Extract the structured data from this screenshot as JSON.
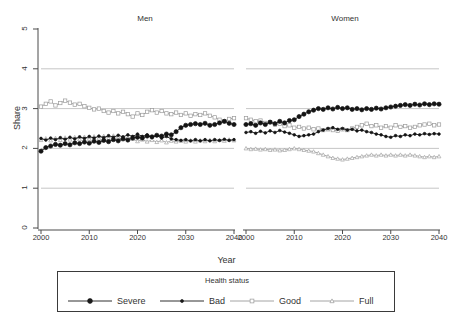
{
  "chart_title": "",
  "axes": {
    "ylabel": "Share",
    "xlabel": "Year",
    "yticks": [
      "0",
      "1",
      "2",
      "3",
      "4",
      "5"
    ],
    "xticks": [
      "2000",
      "2010",
      "2020",
      "2030",
      "2040"
    ],
    "ylim": [
      0,
      5
    ],
    "xlim": [
      2000,
      2040
    ],
    "gridlines_y": [
      1,
      2,
      3,
      4
    ]
  },
  "panels": [
    {
      "key": "men",
      "title": "Men"
    },
    {
      "key": "women",
      "title": "Women"
    }
  ],
  "legend": {
    "title": "Health status",
    "entries": [
      {
        "label": "Severe",
        "marker": "filled-circle-large",
        "color": "#1a1a1a"
      },
      {
        "label": "Bad",
        "marker": "filled-circle-small",
        "color": "#1a1a1a"
      },
      {
        "label": "Good",
        "marker": "open-square",
        "color": "#9a9a9a"
      },
      {
        "label": "Full",
        "marker": "open-triangle",
        "color": "#9a9a9a"
      }
    ]
  },
  "colors": {
    "severe": "#141414",
    "bad": "#141414",
    "good": "#9b9b9b",
    "full": "#a3a3a3",
    "grid": "#b8b8b8",
    "axis": "#4a4a4a"
  },
  "chart_data": {
    "type": "line",
    "title": "",
    "xlabel": "Year",
    "ylabel": "Share",
    "xlim": [
      2000,
      2040
    ],
    "ylim": [
      0,
      5
    ],
    "grid": true,
    "legend_position": "bottom",
    "legend_title": "Health status",
    "x": [
      2000,
      2001,
      2002,
      2003,
      2004,
      2005,
      2006,
      2007,
      2008,
      2009,
      2010,
      2011,
      2012,
      2013,
      2014,
      2015,
      2016,
      2017,
      2018,
      2019,
      2020,
      2021,
      2022,
      2023,
      2024,
      2025,
      2026,
      2027,
      2028,
      2029,
      2030,
      2031,
      2032,
      2033,
      2034,
      2035,
      2036,
      2037,
      2038,
      2039,
      2040
    ],
    "panels": [
      {
        "name": "Men",
        "series": [
          {
            "name": "Severe",
            "values": [
              1.93,
              2.02,
              2.06,
              2.1,
              2.08,
              2.12,
              2.09,
              2.14,
              2.12,
              2.16,
              2.13,
              2.18,
              2.15,
              2.2,
              2.17,
              2.22,
              2.19,
              2.24,
              2.21,
              2.26,
              2.28,
              2.26,
              2.31,
              2.29,
              2.33,
              2.31,
              2.36,
              2.34,
              2.42,
              2.52,
              2.58,
              2.6,
              2.62,
              2.6,
              2.63,
              2.58,
              2.6,
              2.64,
              2.68,
              2.63,
              2.6
            ]
          },
          {
            "name": "Bad",
            "values": [
              2.25,
              2.21,
              2.26,
              2.22,
              2.27,
              2.23,
              2.28,
              2.24,
              2.29,
              2.25,
              2.3,
              2.26,
              2.31,
              2.27,
              2.32,
              2.28,
              2.33,
              2.29,
              2.34,
              2.3,
              2.36,
              2.3,
              2.34,
              2.28,
              2.32,
              2.26,
              2.3,
              2.24,
              2.22,
              2.2,
              2.22,
              2.19,
              2.22,
              2.19,
              2.22,
              2.19,
              2.22,
              2.2,
              2.23,
              2.2,
              2.22
            ]
          },
          {
            "name": "Good",
            "values": [
              3.05,
              3.12,
              3.18,
              3.08,
              3.14,
              3.2,
              3.15,
              3.1,
              3.12,
              3.06,
              3.02,
              2.98,
              3.0,
              2.94,
              2.9,
              2.94,
              2.88,
              2.92,
              2.86,
              2.8,
              2.88,
              2.84,
              2.92,
              2.96,
              2.9,
              2.94,
              2.88,
              2.86,
              2.9,
              2.84,
              2.88,
              2.82,
              2.86,
              2.84,
              2.88,
              2.82,
              2.78,
              2.72,
              2.68,
              2.74,
              2.76
            ]
          },
          {
            "name": "Full",
            "values": [
              2.21,
              2.25,
              2.2,
              2.26,
              2.21,
              2.27,
              2.22,
              2.28,
              2.23,
              2.29,
              2.24,
              2.3,
              2.25,
              2.31,
              2.26,
              2.32,
              2.27,
              2.23,
              2.28,
              2.24,
              2.18,
              2.22,
              2.17,
              2.21,
              2.16,
              2.2,
              2.15,
              2.19,
              2.17,
              2.19,
              2.17,
              2.2,
              2.17,
              2.2,
              2.18,
              2.21,
              2.18,
              2.21,
              2.19,
              2.22,
              2.2
            ]
          }
        ]
      },
      {
        "name": "Women",
        "series": [
          {
            "name": "Severe",
            "values": [
              2.6,
              2.62,
              2.58,
              2.64,
              2.6,
              2.66,
              2.62,
              2.68,
              2.64,
              2.7,
              2.72,
              2.8,
              2.86,
              2.92,
              2.96,
              3.0,
              2.98,
              3.02,
              2.99,
              3.03,
              3.0,
              3.02,
              2.98,
              3.0,
              2.97,
              3.0,
              2.98,
              3.01,
              2.99,
              3.02,
              3.04,
              3.06,
              3.08,
              3.1,
              3.08,
              3.11,
              3.09,
              3.12,
              3.1,
              3.12,
              3.11
            ]
          },
          {
            "name": "Bad",
            "values": [
              2.4,
              2.42,
              2.38,
              2.43,
              2.39,
              2.44,
              2.4,
              2.45,
              2.41,
              2.38,
              2.34,
              2.3,
              2.32,
              2.34,
              2.36,
              2.42,
              2.46,
              2.5,
              2.52,
              2.48,
              2.5,
              2.46,
              2.48,
              2.44,
              2.46,
              2.42,
              2.4,
              2.36,
              2.34,
              2.3,
              2.28,
              2.32,
              2.3,
              2.34,
              2.32,
              2.36,
              2.34,
              2.37,
              2.35,
              2.37,
              2.36
            ]
          },
          {
            "name": "Good",
            "values": [
              2.76,
              2.72,
              2.68,
              2.7,
              2.64,
              2.66,
              2.6,
              2.62,
              2.56,
              2.58,
              2.52,
              2.54,
              2.5,
              2.52,
              2.48,
              2.5,
              2.46,
              2.48,
              2.46,
              2.44,
              2.48,
              2.46,
              2.5,
              2.54,
              2.58,
              2.62,
              2.56,
              2.58,
              2.52,
              2.56,
              2.52,
              2.58,
              2.54,
              2.56,
              2.52,
              2.54,
              2.58,
              2.6,
              2.62,
              2.58,
              2.6
            ]
          },
          {
            "name": "Full",
            "values": [
              2.0,
              1.98,
              1.99,
              1.97,
              1.98,
              1.96,
              1.97,
              1.95,
              1.96,
              1.98,
              2.0,
              1.98,
              1.96,
              1.94,
              1.92,
              1.88,
              1.84,
              1.8,
              1.76,
              1.74,
              1.72,
              1.74,
              1.76,
              1.78,
              1.8,
              1.82,
              1.84,
              1.82,
              1.84,
              1.82,
              1.84,
              1.82,
              1.84,
              1.82,
              1.84,
              1.82,
              1.8,
              1.78,
              1.8,
              1.78,
              1.8
            ]
          }
        ]
      }
    ]
  }
}
